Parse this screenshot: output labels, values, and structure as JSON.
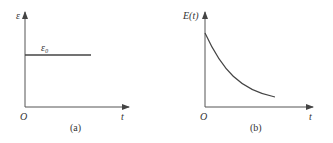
{
  "panels": [
    {
      "caption": "(a)",
      "y_label": "ε",
      "x_label": "t",
      "origin_label": "O",
      "curve_label": "ε₀",
      "description": "constant strain ε0 over time"
    },
    {
      "caption": "(b)",
      "y_label": "E(t)",
      "x_label": "t",
      "origin_label": "O",
      "description": "relaxation modulus decaying with time"
    }
  ],
  "colors": {
    "line": "#444444",
    "axis": "#555555",
    "text": "#333333"
  }
}
